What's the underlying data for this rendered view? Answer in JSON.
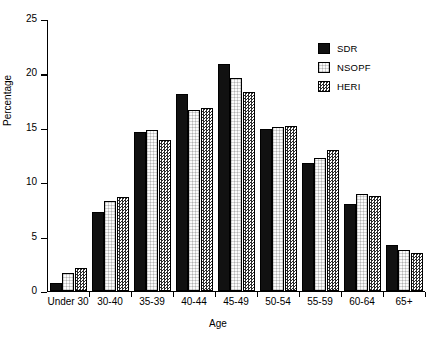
{
  "chart_data": {
    "type": "bar",
    "title": "",
    "xlabel": "Age",
    "ylabel": "Percentage",
    "ylim": [
      0,
      25
    ],
    "yticks": [
      0,
      5,
      10,
      15,
      20,
      25
    ],
    "grid": false,
    "legend_position": "top-right",
    "categories": [
      "Under 30",
      "30-40",
      "35-39",
      "40-44",
      "45-49",
      "50-54",
      "55-59",
      "60-64",
      "65+"
    ],
    "series": [
      {
        "name": "SDR",
        "fill": "solid-black",
        "color": "#111111",
        "values": [
          0.7,
          7.2,
          14.6,
          18.1,
          20.8,
          14.9,
          11.7,
          8.0,
          4.2
        ]
      },
      {
        "name": "NSOPF",
        "fill": "white-dotted",
        "color": "#fbfbfb",
        "values": [
          1.6,
          8.2,
          14.8,
          16.6,
          19.5,
          15.0,
          12.2,
          8.9,
          3.7
        ]
      },
      {
        "name": "HERI",
        "fill": "checkered",
        "color": "#888888",
        "values": [
          2.1,
          8.6,
          13.8,
          16.8,
          18.3,
          15.1,
          12.9,
          8.7,
          3.5
        ]
      }
    ]
  },
  "axis": {
    "y_title": "Percentage",
    "x_title": "Age",
    "y_tick_labels": [
      "0",
      "5",
      "10",
      "15",
      "20",
      "25"
    ]
  },
  "legend": {
    "entries": [
      {
        "label": "SDR"
      },
      {
        "label": "NSOPF"
      },
      {
        "label": "HERI"
      }
    ]
  }
}
